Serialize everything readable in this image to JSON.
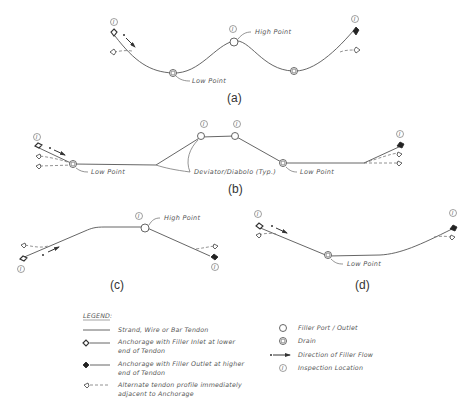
{
  "diagrams": {
    "a": {
      "caption": "(a)",
      "high_point": "High Point",
      "low_point": "Low Point"
    },
    "b": {
      "caption": "(b)",
      "low_point_left": "Low Point",
      "low_point_right": "Low Point",
      "deviator": "Deviator/Diabolo (Typ.)"
    },
    "c": {
      "caption": "(c)",
      "high_point": "High Point"
    },
    "d": {
      "caption": "(d)",
      "low_point": "Low Point"
    }
  },
  "inspection_symbol": "I",
  "legend": {
    "title": "LEGEND:",
    "items": [
      {
        "symbol": "strand-line",
        "label": "Strand, Wire or Bar Tendon"
      },
      {
        "symbol": "anchorage-inlet",
        "label_line1": "Anchorage with Filler Inlet at lower",
        "label_line2": "end of Tendon"
      },
      {
        "symbol": "anchorage-outlet",
        "label_line1": "Anchorage with Filler Outlet at higher",
        "label_line2": "end of Tendon"
      },
      {
        "symbol": "alternate-profile",
        "label_line1": "Alternate tendon profile immediately",
        "label_line2": "adjacent to Anchorage"
      },
      {
        "symbol": "filler-port",
        "label": "Filler Port / Outlet"
      },
      {
        "symbol": "drain",
        "label": "Drain"
      },
      {
        "symbol": "flow-arrow",
        "label": "Direction of Filler Flow"
      },
      {
        "symbol": "inspection",
        "label": "Inspection Location"
      }
    ]
  },
  "colors": {
    "line": "#555555",
    "anchorage_outlet": "#222222",
    "background": "#ffffff"
  }
}
